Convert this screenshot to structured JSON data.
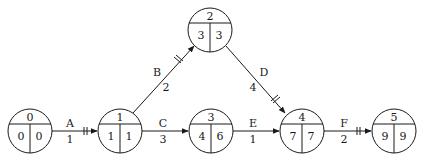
{
  "diagram": {
    "type": "activity-on-arrow network",
    "colors": {
      "stroke": "#1a1a1a",
      "background": "#ffffff"
    },
    "nodes": [
      {
        "id": "0",
        "cx": 30,
        "cy": 131,
        "number": "0",
        "early": "0",
        "late": "0"
      },
      {
        "id": "1",
        "cx": 120,
        "cy": 131,
        "number": "1",
        "early": "1",
        "late": "1"
      },
      {
        "id": "2",
        "cx": 210,
        "cy": 30,
        "number": "2",
        "early": "3",
        "late": "3"
      },
      {
        "id": "3",
        "cx": 211,
        "cy": 131,
        "number": "3",
        "early": "4",
        "late": "6"
      },
      {
        "id": "4",
        "cx": 302,
        "cy": 131,
        "number": "4",
        "early": "7",
        "late": "7"
      },
      {
        "id": "5",
        "cx": 394,
        "cy": 131,
        "number": "5",
        "early": "9",
        "late": "9"
      }
    ],
    "edges": [
      {
        "from": "0",
        "to": "1",
        "activity": "A",
        "duration": "1",
        "critical": true
      },
      {
        "from": "1",
        "to": "2",
        "activity": "B",
        "duration": "2",
        "critical": true
      },
      {
        "from": "1",
        "to": "3",
        "activity": "C",
        "duration": "3",
        "critical": false
      },
      {
        "from": "2",
        "to": "4",
        "activity": "D",
        "duration": "4",
        "critical": true
      },
      {
        "from": "3",
        "to": "4",
        "activity": "E",
        "duration": "1",
        "critical": false
      },
      {
        "from": "4",
        "to": "5",
        "activity": "F",
        "duration": "2",
        "critical": true
      }
    ]
  }
}
